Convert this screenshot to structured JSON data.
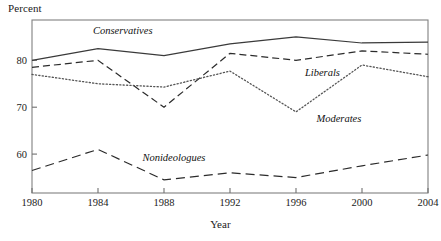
{
  "chart_data": {
    "type": "line",
    "title": "",
    "xlabel": "Year",
    "ylabel": "Percent",
    "x": [
      1980,
      1984,
      1988,
      1992,
      1996,
      2000,
      2004
    ],
    "xtick_labels": [
      "1980",
      "1984",
      "1988",
      "1992",
      "1996",
      "2000",
      "2004"
    ],
    "ytick_labels": [
      "60",
      "70",
      "80"
    ],
    "yticks": [
      60,
      70,
      80
    ],
    "xlim": [
      1980,
      2004
    ],
    "ylim": [
      51.7,
      88.6
    ],
    "grid": false,
    "legend_position": "inline-annotations",
    "frame": "box",
    "series": [
      {
        "name": "Conservatives",
        "style": "solid",
        "color": "#3a3a3a",
        "values": [
          80.0,
          82.5,
          81.0,
          83.5,
          85.0,
          83.7,
          83.9
        ],
        "label_x": 1985.5,
        "label_y": 86.5
      },
      {
        "name": "Liberals",
        "style": "dashed",
        "color": "#2b2b2b",
        "values": [
          78.5,
          80.0,
          70.0,
          81.5,
          80.0,
          82.0,
          81.3
        ],
        "label_x": 1997.6,
        "label_y": 77.6
      },
      {
        "name": "Moderates",
        "style": "dotted",
        "color": "#555555",
        "values": [
          77.0,
          75.0,
          74.3,
          77.7,
          69.0,
          79.0,
          76.5
        ],
        "label_x": 1998.6,
        "label_y": 67.6
      },
      {
        "name": "Nonideologues",
        "style": "long-dashed",
        "color": "#2b2b2b",
        "values": [
          56.5,
          61.0,
          54.5,
          56.0,
          55.0,
          57.5,
          59.8
        ],
        "label_x": 1988.6,
        "label_y": 59.4
      }
    ]
  },
  "axes": {
    "ylabel": "Percent",
    "xlabel": "Year"
  }
}
